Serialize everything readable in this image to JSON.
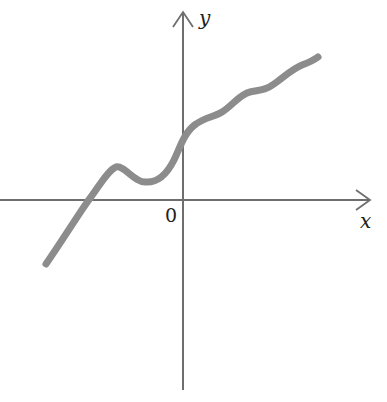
{
  "figure": {
    "x_axis_label": "x",
    "y_axis_label": "y",
    "origin_label": "0",
    "colors": {
      "axis": "#6e6e6e",
      "curve": "#8c8c8c",
      "text": "#222222",
      "background": "#ffffff"
    },
    "axes": {
      "origin_px": [
        183,
        200
      ],
      "x_axis_px": {
        "from": 0,
        "to": 370
      },
      "y_axis_px": {
        "from": 390,
        "to": 12
      }
    },
    "curve_points_px": [
      [
        46,
        264
      ],
      [
        66,
        234
      ],
      [
        88,
        201
      ],
      [
        104,
        180
      ],
      [
        116,
        167
      ],
      [
        128,
        172
      ],
      [
        145,
        182
      ],
      [
        160,
        180
      ],
      [
        172,
        166
      ],
      [
        183,
        142
      ],
      [
        196,
        124
      ],
      [
        210,
        116
      ],
      [
        222,
        112
      ],
      [
        236,
        101
      ],
      [
        248,
        92
      ],
      [
        262,
        89
      ],
      [
        274,
        84
      ],
      [
        288,
        72
      ],
      [
        302,
        65
      ],
      [
        318,
        57
      ]
    ]
  }
}
